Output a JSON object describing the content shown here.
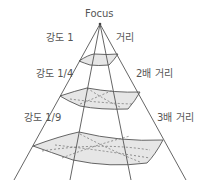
{
  "diagram": {
    "focus_label": "Focus",
    "labels": {
      "intensity_1": "강도 1",
      "distance_1": "거리",
      "intensity_1_4": "강도 1/4",
      "distance_2": "2배 거리",
      "intensity_1_9": "강도 1/9",
      "distance_3": "3배 거리"
    },
    "colors": {
      "line": "#555555",
      "fill": "#e6e6e6",
      "text": "#555555"
    }
  }
}
